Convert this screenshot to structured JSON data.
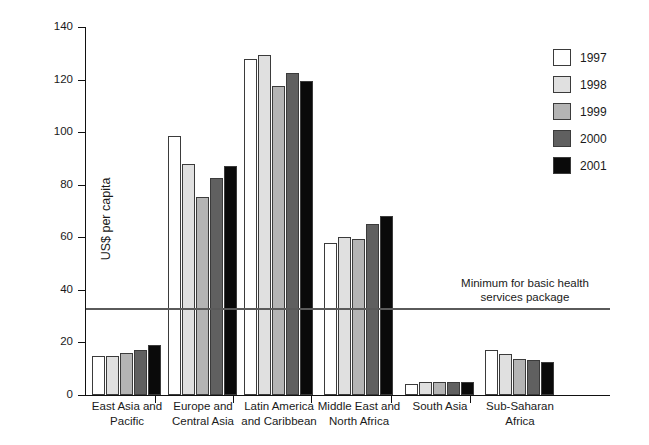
{
  "chart_data": {
    "type": "bar",
    "title": "",
    "subtitle": "",
    "xlabel": "",
    "ylabel": "US$ per capita",
    "ylim": [
      0,
      140
    ],
    "yticks": [
      0,
      20,
      40,
      60,
      80,
      100,
      120,
      140
    ],
    "grid": false,
    "legend_position": "right-top",
    "categories": [
      "East Asia and\nPacific",
      "Europe and\nCentral Asia",
      "Latin America\nand Caribbean",
      "Middle East and\nNorth Africa",
      "South Asia",
      "Sub-Saharan\nAfrica"
    ],
    "series": [
      {
        "name": "1997",
        "color": "#ffffff",
        "values": [
          15.0,
          98.5,
          128.0,
          58.0,
          4.3,
          17.0
        ]
      },
      {
        "name": "1998",
        "color": "#e0e0e0",
        "values": [
          15.0,
          88.0,
          129.5,
          60.0,
          5.0,
          15.5
        ]
      },
      {
        "name": "1999",
        "color": "#b4b4b4",
        "values": [
          16.0,
          75.5,
          117.5,
          59.5,
          5.0,
          13.8
        ]
      },
      {
        "name": "2000",
        "color": "#606060",
        "values": [
          17.0,
          82.5,
          122.5,
          65.0,
          5.0,
          13.5
        ]
      },
      {
        "name": "2001",
        "color": "#0a0a0a",
        "values": [
          19.0,
          87.0,
          119.5,
          68.0,
          5.0,
          12.5
        ]
      }
    ],
    "annotations": [
      {
        "name": "minimum-reference-line",
        "label": "Minimum for basic health\nservices package",
        "value": 33,
        "line_color": "#5a5a5a"
      }
    ]
  },
  "legend": {
    "items": [
      {
        "label": "1997"
      },
      {
        "label": "1998"
      },
      {
        "label": "1999"
      },
      {
        "label": "2000"
      },
      {
        "label": "2001"
      }
    ]
  }
}
